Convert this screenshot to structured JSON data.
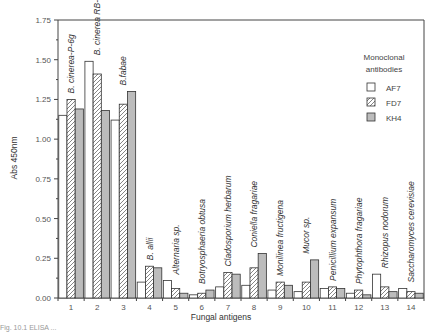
{
  "chart_data": {
    "type": "bar",
    "title": "",
    "xlabel": "Fungal antigens",
    "ylabel": "Abs 450nm",
    "ylim": [
      0,
      1.75
    ],
    "yticks": [
      "0.00",
      "0.25",
      "0.50",
      "0.75",
      "1.00",
      "1.25",
      "1.50",
      "1.75"
    ],
    "categories": [
      "1",
      "2",
      "3",
      "4",
      "5",
      "6",
      "7",
      "8",
      "9",
      "10",
      "11",
      "12",
      "13",
      "14"
    ],
    "category_names": [
      "B. cinerea-P-6g",
      "B. cinerea RB-1",
      "B.fabae",
      "B. allii",
      "Alternaria sp.",
      "Botryosphaeria obtusa",
      "Cladosporium herbarum",
      "Coniella fragariae",
      "Monilinea fructigena",
      "Mucor sp.",
      "Penicillium expansum",
      "Phytophthora fragariae",
      "Rhizopus nodorum",
      "Saccharomyces cerevisiae"
    ],
    "legend_title": "Monoclonal antibodies",
    "legend_position": "top-right",
    "grid": false,
    "series": [
      {
        "name": "AF7",
        "pattern": "open",
        "values": [
          1.15,
          1.49,
          1.12,
          0.1,
          0.11,
          0.02,
          0.07,
          0.08,
          0.05,
          0.04,
          0.06,
          0.03,
          0.15,
          0.06
        ]
      },
      {
        "name": "FD7",
        "pattern": "hatched",
        "values": [
          1.25,
          1.41,
          1.22,
          0.2,
          0.06,
          0.03,
          0.16,
          0.19,
          0.1,
          0.1,
          0.07,
          0.05,
          0.07,
          0.04
        ]
      },
      {
        "name": "KH4",
        "pattern": "gray",
        "values": [
          1.19,
          1.18,
          1.3,
          0.19,
          0.03,
          0.05,
          0.15,
          0.28,
          0.08,
          0.24,
          0.06,
          0.02,
          0.04,
          0.03
        ]
      }
    ]
  },
  "colors": {
    "open": "#ffffff",
    "hatch": "#777777",
    "gray": "#bdbdbd",
    "stroke": "#333333"
  },
  "caption": "Fig. 10.1    ELISA ..."
}
